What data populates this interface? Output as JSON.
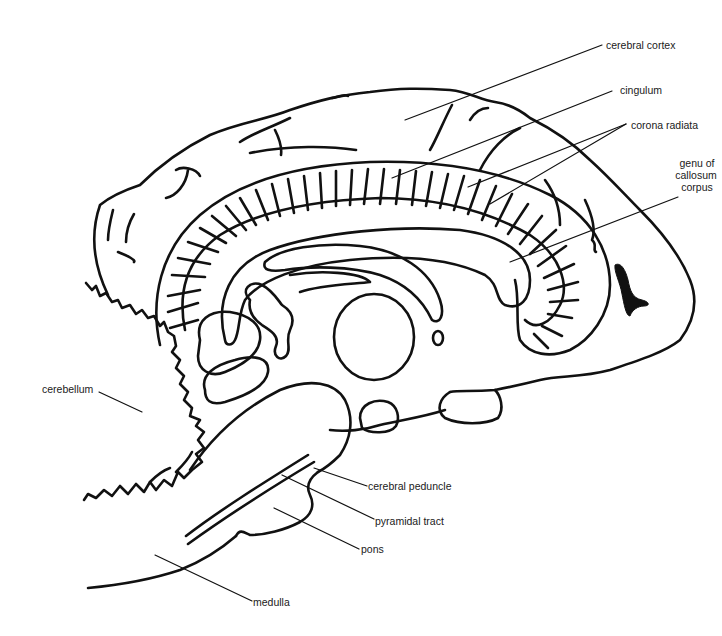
{
  "diagram": {
    "type": "anatomical sagittal section of brain (line drawing)",
    "colors": {
      "line": "#111111",
      "background": "#ffffff",
      "text": "#1a1a1a"
    },
    "labels": {
      "cerebral_cortex": "cerebral cortex",
      "cingulum": "cingulum",
      "corona_radiata": "corona radiata",
      "genu_line1": "genu of",
      "genu_line2": "callosum",
      "genu_line3": "corpus",
      "cerebellum": "cerebellum",
      "cerebral_peduncle": "cerebral peduncle",
      "pyramidal_tract": "pyramidal tract",
      "pons": "pons",
      "medulla": "medulla"
    }
  }
}
